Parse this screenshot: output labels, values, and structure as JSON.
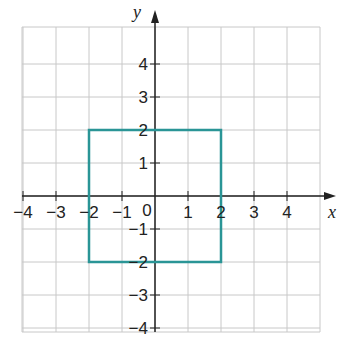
{
  "chart_data": {
    "type": "diagram",
    "title": "",
    "xlabel": "x",
    "ylabel": "y",
    "origin_label": "0",
    "x_ticks": [
      -4,
      -3,
      -2,
      -1,
      1,
      2,
      3,
      4
    ],
    "y_ticks": [
      4,
      3,
      2,
      1,
      -1,
      -2,
      -3,
      -4
    ],
    "x_tick_labels": [
      "−4",
      "−3",
      "−2",
      "−1",
      "1",
      "2",
      "3",
      "4"
    ],
    "y_tick_labels": [
      "4",
      "3",
      "2",
      "1",
      "−1",
      "−2",
      "−3",
      "−4"
    ],
    "grid": true,
    "xlim": [
      -4,
      5
    ],
    "ylim": [
      -4,
      5
    ],
    "shapes": [
      {
        "name": "square",
        "color": "#2a9596",
        "vertices": [
          [
            -2,
            2
          ],
          [
            2,
            2
          ],
          [
            2,
            -2
          ],
          [
            -2,
            -2
          ]
        ]
      }
    ]
  },
  "colors": {
    "grid": "#c8c8c8",
    "axis": "#222222",
    "shape": "#2a9596"
  }
}
